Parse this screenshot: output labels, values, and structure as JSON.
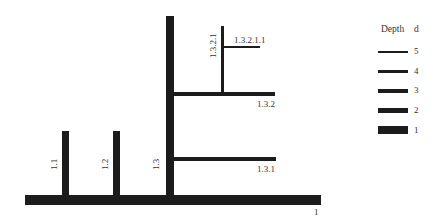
{
  "diagram": {
    "type": "tree-branching",
    "nodes": [
      {
        "id": "1",
        "label": "1",
        "depth": 1,
        "orientation": "horizontal"
      },
      {
        "id": "1.1",
        "label": "1.1",
        "depth": 2,
        "orientation": "vertical"
      },
      {
        "id": "1.2",
        "label": "1.2",
        "depth": 2,
        "orientation": "vertical"
      },
      {
        "id": "1.3",
        "label": "1.3",
        "depth": 2,
        "orientation": "vertical"
      },
      {
        "id": "1.3.1",
        "label": "1.3.1",
        "depth": 3,
        "orientation": "horizontal"
      },
      {
        "id": "1.3.2",
        "label": "1.3.2",
        "depth": 3,
        "orientation": "horizontal"
      },
      {
        "id": "1.3.2.1",
        "label": "1.3.2.1",
        "depth": 4,
        "orientation": "vertical"
      },
      {
        "id": "1.3.2.1.1",
        "label": "1.3.2.1.1",
        "depth": 5,
        "orientation": "horizontal"
      }
    ]
  },
  "legend": {
    "title": "Depth",
    "column": "d",
    "items": [
      {
        "label": "5"
      },
      {
        "label": "4"
      },
      {
        "label": "3"
      },
      {
        "label": "2"
      },
      {
        "label": "1"
      }
    ]
  },
  "colors": {
    "line": "#1c1c1c",
    "background": "#ffffff"
  }
}
